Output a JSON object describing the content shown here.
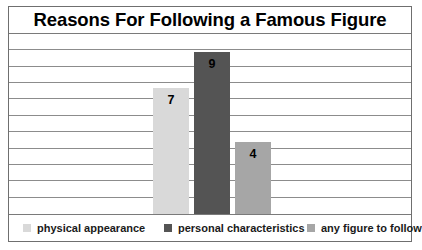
{
  "chart_data": {
    "type": "bar",
    "title": "Reasons For Following a Famous Figure",
    "xlabel": "",
    "ylabel": "",
    "ylim": [
      0,
      10
    ],
    "grid": true,
    "gridline_count": 10,
    "legend_position": "bottom",
    "categories": [
      "physical appearance",
      "personal characteristics",
      "any figure to follow"
    ],
    "values": [
      7,
      9,
      4
    ],
    "value_labels": [
      "7",
      "9",
      "4"
    ],
    "colors": [
      "#d9d9d9",
      "#545454",
      "#a6a6a6"
    ],
    "series": [
      {
        "name": "Reasons For Following a Famous Figure",
        "values": [
          7,
          9,
          4
        ]
      }
    ]
  },
  "legend": {
    "items": [
      {
        "label": "physical appearance",
        "color": "#d9d9d9"
      },
      {
        "label": "personal characteristics",
        "color": "#545454"
      },
      {
        "label": "any figure to follow",
        "color": "#a6a6a6"
      }
    ]
  }
}
